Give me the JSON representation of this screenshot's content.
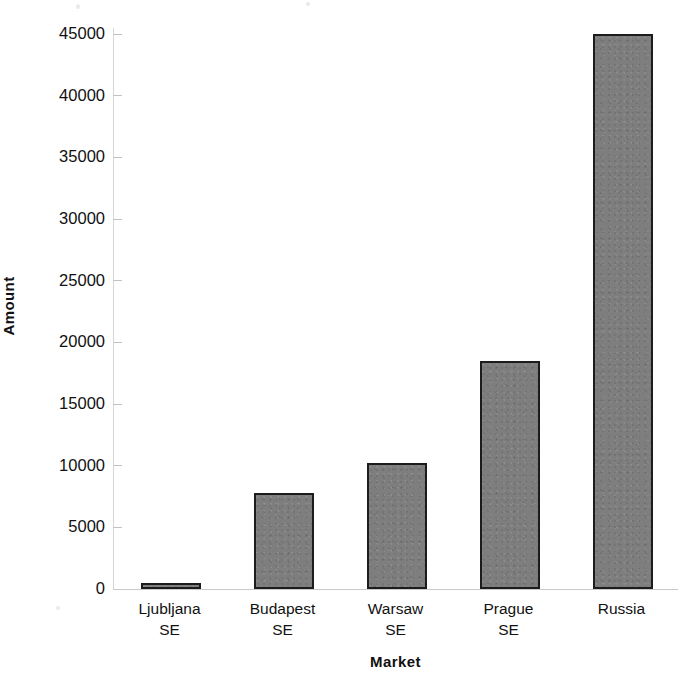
{
  "chart_data": {
    "type": "bar",
    "title": "",
    "xlabel": "Market",
    "ylabel": "Amount",
    "categories": [
      "Ljubljana SE",
      "Budapest SE",
      "Warsaw SE",
      "Prague SE",
      "Russia"
    ],
    "category_lines": [
      [
        "Ljubljana",
        "SE"
      ],
      [
        "Budapest",
        "SE"
      ],
      [
        "Warsaw",
        "SE"
      ],
      [
        "Prague",
        "SE"
      ],
      [
        "Russia",
        ""
      ]
    ],
    "values": [
      500,
      7800,
      10200,
      18500,
      45000
    ],
    "ylim": [
      0,
      45000
    ],
    "yticks": [
      0,
      5000,
      10000,
      15000,
      20000,
      25000,
      30000,
      35000,
      40000,
      45000
    ],
    "ytick_labels": [
      "0",
      "5000",
      "10000",
      "15000",
      "20000",
      "25000",
      "30000",
      "35000",
      "40000",
      "45000"
    ],
    "grid": false,
    "legend": false,
    "legend_position": "none",
    "bar_color": "#7e7e7e",
    "bar_border_color": "#1c1c1c",
    "axis_color": "#c9c9c9",
    "text_color": "#111111"
  },
  "axes": {
    "y_title": "Amount",
    "x_title": "Market"
  }
}
